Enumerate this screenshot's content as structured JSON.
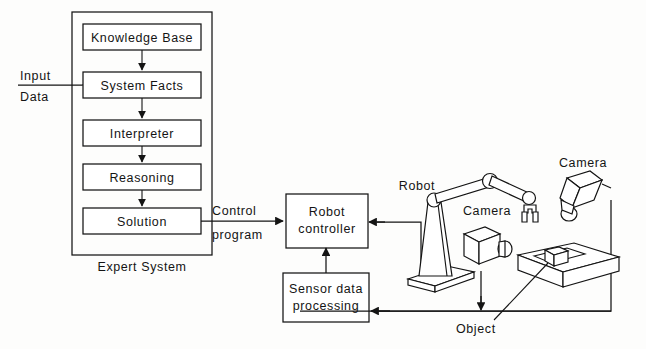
{
  "diagram": {
    "expert_system": {
      "caption": "Expert System",
      "input_label_top": "Input",
      "input_label_bottom": "Data",
      "boxes": [
        {
          "id": "knowledge-base",
          "label": "Knowledge Base"
        },
        {
          "id": "system-facts",
          "label": "System Facts"
        },
        {
          "id": "interpreter",
          "label": "Interpreter"
        },
        {
          "id": "reasoning",
          "label": "Reasoning"
        },
        {
          "id": "solution",
          "label": "Solution"
        }
      ]
    },
    "control_link": {
      "label_top": "Control",
      "label_bottom": "program"
    },
    "control_boxes": [
      {
        "id": "robot-controller",
        "line1": "Robot",
        "line2": "controller"
      },
      {
        "id": "sensor-data-processing",
        "line1": "Sensor data",
        "line2": "processing"
      }
    ],
    "scene_labels": {
      "robot": "Robot",
      "camera_arm": "Camera",
      "camera_fixed": "Camera",
      "object": "Object"
    },
    "colors": {
      "ink": "#141414",
      "paper": "#fdfdfc",
      "fill": "#ffffff"
    }
  }
}
